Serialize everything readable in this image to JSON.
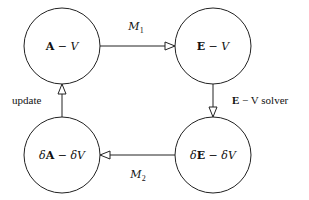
{
  "diagram": {
    "type": "cycle-flowchart",
    "nodes": [
      {
        "id": "A-V",
        "label_bold": "A",
        "label_rest": " − V",
        "position": "top-left"
      },
      {
        "id": "E-V",
        "label_bold": "E",
        "label_rest": " − V",
        "position": "top-right"
      },
      {
        "id": "dE-dV",
        "label_prefix": "δ",
        "label_bold": "E",
        "label_rest": " − δV",
        "position": "bottom-right"
      },
      {
        "id": "dA-dV",
        "label_prefix": "δ",
        "label_bold": "A",
        "label_rest": " − δV",
        "position": "bottom-left"
      }
    ],
    "edges": [
      {
        "from": "A-V",
        "to": "E-V",
        "label_main": "M",
        "label_sub": "1"
      },
      {
        "from": "E-V",
        "to": "dE-dV",
        "label_bold": "E",
        "label_rest": " − V solver"
      },
      {
        "from": "dE-dV",
        "to": "dA-dV",
        "label_main": "M",
        "label_sub": "2"
      },
      {
        "from": "dA-dV",
        "to": "A-V",
        "label_text": "update"
      }
    ]
  }
}
